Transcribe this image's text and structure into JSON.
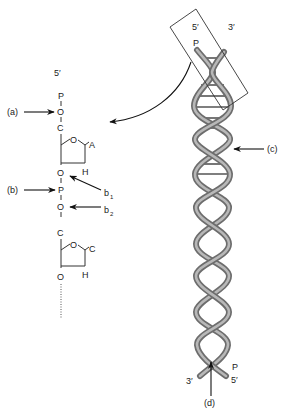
{
  "figure": {
    "nucleotide_chain": {
      "five_prime_label": "5′",
      "atoms": {
        "p_top": "P",
        "o1": "O",
        "c1": "C",
        "ring_o1": "O",
        "base1": "A",
        "h1": "H",
        "o2": "O",
        "p_mid": "P",
        "o3": "O",
        "c2": "C",
        "ring_o2": "O",
        "base2": "C",
        "h2": "H",
        "o4": "O"
      }
    },
    "callouts": {
      "a": "(a)",
      "b": "(b)",
      "b1_main": "b",
      "b1_sub": "1",
      "b2_main": "b",
      "b2_sub": "2",
      "c": "(c)",
      "d": "(d)"
    },
    "helix": {
      "top_five_prime": "5′",
      "top_three_prime": "3′",
      "top_p": "P",
      "bottom_three_prime": "3′",
      "bottom_five_prime": "5′",
      "bottom_p": "P"
    },
    "colors": {
      "strand_outer": "#6d6d6d",
      "strand_inner": "#b8b8b8",
      "text": "#222222",
      "background": "#ffffff"
    }
  }
}
